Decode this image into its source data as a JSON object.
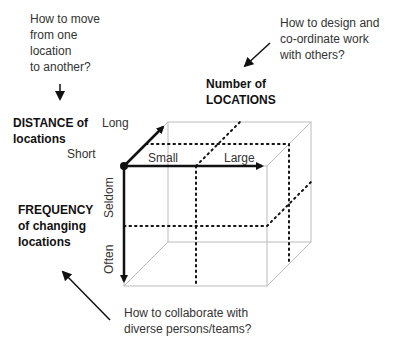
{
  "questions": {
    "move": [
      "How to move",
      "from one",
      "location",
      "to another?"
    ],
    "design": [
      "How to design and",
      "co-ordinate work",
      "with others?"
    ],
    "collaborate": [
      "How to collaborate with",
      "diverse persons/teams?"
    ]
  },
  "dimensions": {
    "number": {
      "title": [
        "Number of",
        "LOCATIONS"
      ],
      "low": "Small",
      "high": "Large"
    },
    "distance": {
      "title": [
        "DISTANCE of",
        "locations"
      ],
      "low": "Short",
      "high": "Long"
    },
    "frequency": {
      "title": [
        "FREQUENCY",
        "of changing",
        "locations"
      ],
      "low": "Seldom",
      "high": "Often"
    }
  }
}
